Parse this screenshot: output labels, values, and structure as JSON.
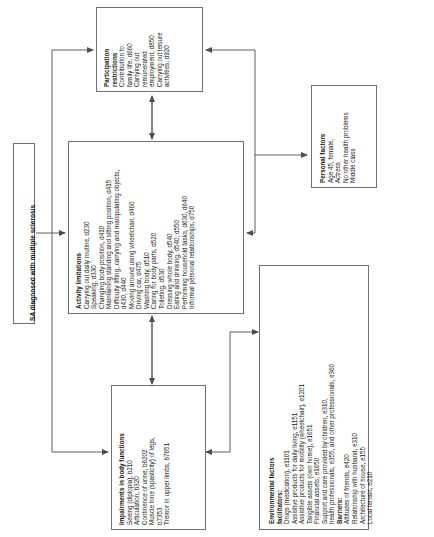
{
  "diagram": {
    "type": "icf-model",
    "orientation": "rotated-90-ccw",
    "title_banner": "SA diagnosed with multiple sclerosis",
    "stroke_color": "#6f6f6f",
    "text_color": "#1a1a1a"
  },
  "boxes": {
    "participation": {
      "title_line1": "Participation",
      "title_line2": "restrictions",
      "items": [
        "Contribution to",
        "family life, d660",
        "Carrying out",
        "remunerated",
        "employment, d850",
        "Carrying out leisure",
        "activities, d920"
      ]
    },
    "activity": {
      "title": "Activity limitations",
      "items": [
        "Carrying out daily routine, d230",
        "Speaking, d330",
        "Changing body position, d410",
        "Maintaining standing and sitting position, d415",
        "Difficulty lifting, carrying and manipulating objects,",
        "d430, d440",
        "Moving around using wheelchair, d460",
        "Driving car, d475",
        "Washing body, d510",
        "Caring for body parts, d520",
        "Toileting, d530",
        "Dressing whole body, d540",
        "Eating and drinking, d540, d550",
        "Performing household tasks, d630, d640",
        "Informal personal relationships, d750"
      ]
    },
    "impairments": {
      "title": "Impairments in body functions",
      "items": [
        "Seeing (diplopia), b210",
        "Articulation, b320",
        "Continence of urine, b6202",
        "Muscle tone (spasticity) of legs,",
        "b7353",
        "Tremor in upper limbs, b7651"
      ]
    },
    "environmental": {
      "title": "Environmental factors",
      "facilitators_label": "facilitators:",
      "facilitators": [
        "Drugs (medication), e1101",
        "Assistive products for daily living, e1151",
        "Assistive products for mobility (wheelchair), e1201",
        "Tangible assets (own home), e1651",
        "Financial assets, e1650",
        "Support and care provided by children, e310,",
        "health professionals, e355, and other professionals, e360"
      ],
      "barriers_label": "Barriers:",
      "barriers": [
        "Attitudes of friends, e420",
        "Relationship with husband, e310",
        "Architecture of house, e155",
        "Local terrain, e210"
      ]
    },
    "personal": {
      "title": "Personal factors",
      "items": [
        "Age 45, female,",
        "Actress",
        "No other health problems",
        "Middle class"
      ]
    }
  }
}
